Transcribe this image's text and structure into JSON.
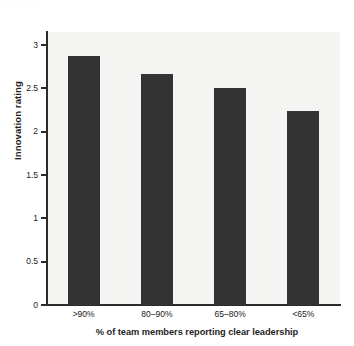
{
  "figure": {
    "top_caption_remnant": "· · ·  ·  ·   ·"
  },
  "chart_data": {
    "type": "bar",
    "title": "",
    "subtitle": "",
    "xlabel": "% of team members reporting clear leadership",
    "ylabel": "Innovation rating",
    "categories": [
      ">90%",
      "80–90%",
      "65–80%",
      "<65%"
    ],
    "values": [
      2.87,
      2.67,
      2.5,
      2.24
    ],
    "series": [
      {
        "name": "Innovation rating",
        "values": [
          2.87,
          2.67,
          2.5,
          2.24
        ]
      }
    ],
    "ylim": [
      0,
      3.15
    ],
    "yticks": [
      0,
      0.5,
      1,
      1.5,
      2,
      2.5,
      3
    ],
    "ytick_labels": [
      "0",
      "0.5",
      "1",
      "1.5",
      "2",
      "2.5",
      "3"
    ],
    "grid": false,
    "legend": null,
    "legend_position": "none",
    "bar_color": "#333333",
    "plot_background": "#f4f4f2",
    "axis_color": "#2b2b2b",
    "annotations": []
  }
}
